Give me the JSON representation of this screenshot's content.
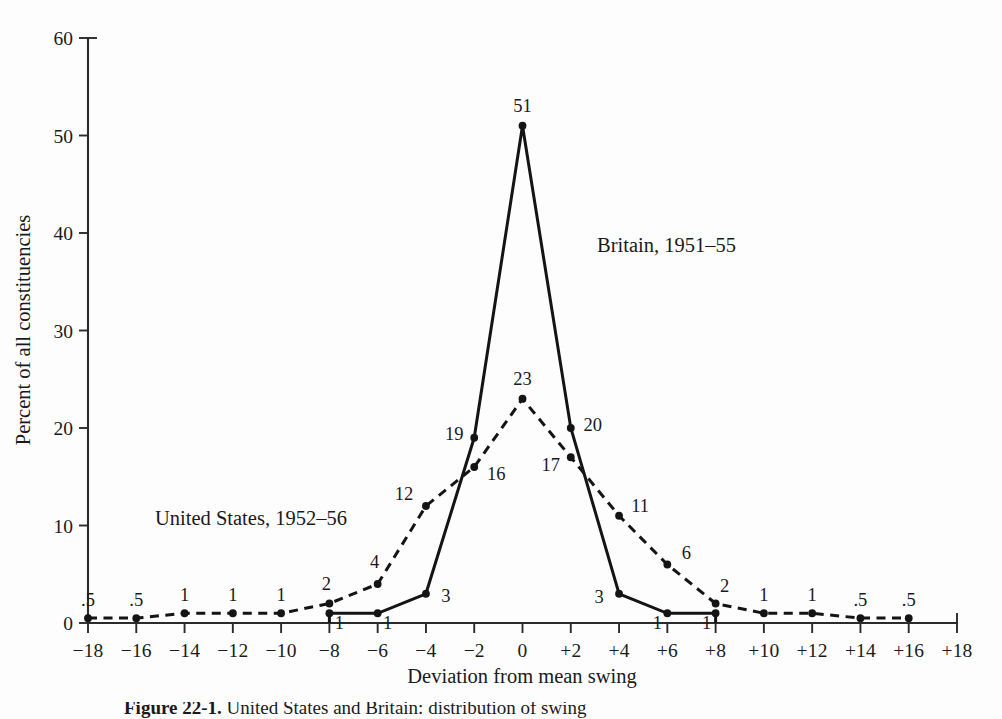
{
  "figure": {
    "caption_label": "Figure 22-1.",
    "caption_text": "United States and Britain: distribution of swing",
    "background_color": "#fdfdfd",
    "ink_color": "#141414"
  },
  "axes": {
    "y_title": "Percent of all constituencies",
    "x_title": "Deviation from mean swing",
    "y_ticks": [
      "0",
      "10",
      "20",
      "30",
      "40",
      "50",
      "60"
    ],
    "x_ticks": [
      "−18",
      "−16",
      "−14",
      "−12",
      "−10",
      "−8",
      "−6",
      "−4",
      "−2",
      "0",
      "+2",
      "+4",
      "+6",
      "+8",
      "+10",
      "+12",
      "+14",
      "+16",
      "+18"
    ]
  },
  "series_labels": {
    "britain": "Britain, 1951–55",
    "united_states": "United States, 1952–56"
  },
  "chart_data": {
    "type": "line",
    "title": "United States and Britain: distribution of swing",
    "xlabel": "Deviation from mean swing",
    "ylabel": "Percent of all constituencies",
    "xlim": [
      -18,
      18
    ],
    "ylim": [
      0,
      60
    ],
    "xtick_step": 2,
    "ytick_step": 10,
    "grid": false,
    "legend": "inline-annotations",
    "x": [
      -18,
      -16,
      -14,
      -12,
      -10,
      -8,
      -6,
      -4,
      -2,
      0,
      2,
      4,
      6,
      8,
      10,
      12,
      14,
      16,
      18
    ],
    "series": [
      {
        "name": "Britain, 1951–55",
        "style": "solid",
        "x": [
          -8,
          -6,
          -4,
          -2,
          0,
          2,
          4,
          6,
          8
        ],
        "values": [
          1,
          1,
          3,
          19,
          51,
          20,
          3,
          1,
          1
        ],
        "point_labels": [
          "1",
          "1",
          "3",
          "19",
          "51",
          "20",
          "3",
          "1",
          "1"
        ],
        "drops_to_zero_at": [
          -8,
          8
        ]
      },
      {
        "name": "United States, 1952–56",
        "style": "dashed",
        "x": [
          -18,
          -16,
          -14,
          -12,
          -10,
          -8,
          -6,
          -4,
          -2,
          0,
          2,
          4,
          6,
          8,
          10,
          12,
          14,
          16
        ],
        "values": [
          0.5,
          0.5,
          1,
          1,
          1,
          2,
          4,
          12,
          16,
          23,
          17,
          11,
          6,
          2,
          1,
          1,
          0.5,
          0.5
        ],
        "point_labels": [
          ".5",
          ".5",
          "1",
          "1",
          "1",
          "2",
          "4",
          "12",
          "16",
          "23",
          "17",
          "11",
          "6",
          "2",
          "1",
          "1",
          ".5",
          ".5"
        ]
      }
    ]
  }
}
